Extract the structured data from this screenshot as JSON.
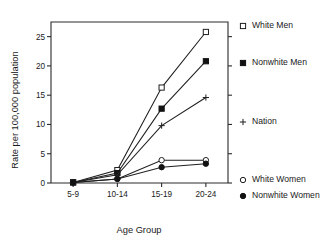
{
  "chart_data": {
    "type": "line",
    "title": "",
    "xlabel": "Age Group",
    "ylabel": "Rate per 100,000 population",
    "categories": [
      "5-9",
      "10-14",
      "15-19",
      "20-24"
    ],
    "ylim": [
      0,
      27.5
    ],
    "yticks": [
      0,
      5,
      10,
      15,
      20,
      25
    ],
    "ytick_labels": [
      "0",
      "5",
      "10",
      "15",
      "20",
      "25"
    ],
    "grid": false,
    "legend_position": "right",
    "series": [
      {
        "name": "White Men",
        "marker": "open-square",
        "values": [
          0.1,
          2.2,
          16.3,
          25.8
        ]
      },
      {
        "name": "Nonwhite Men",
        "marker": "filled-square",
        "values": [
          0.1,
          1.7,
          12.7,
          20.8
        ]
      },
      {
        "name": "Nation",
        "marker": "plus",
        "values": [
          0.1,
          1.4,
          9.8,
          14.6
        ]
      },
      {
        "name": "White Women",
        "marker": "open-circle",
        "values": [
          0.1,
          0.7,
          3.9,
          3.9
        ]
      },
      {
        "name": "Nonwhite Women",
        "marker": "filled-circle",
        "values": [
          0.1,
          0.7,
          2.7,
          3.3
        ]
      }
    ]
  },
  "axes": {
    "y_title": "Rate per 100,000 population",
    "x_title": "Age Group",
    "y_tick_0": "0",
    "y_tick_5": "5",
    "y_tick_10": "10",
    "y_tick_15": "15",
    "y_tick_20": "20",
    "y_tick_25": "25",
    "x_tick_0": "5-9",
    "x_tick_1": "10-14",
    "x_tick_2": "15-19",
    "x_tick_3": "20-24"
  },
  "legend": {
    "entries": [
      {
        "label": "White Men",
        "marker": "open-square"
      },
      {
        "label": "Nonwhite Men",
        "marker": "filled-square"
      },
      {
        "label": "Nation",
        "marker": "plus"
      },
      {
        "label": "White Women",
        "marker": "open-circle"
      },
      {
        "label": "Nonwhite Women",
        "marker": "filled-circle"
      }
    ]
  }
}
